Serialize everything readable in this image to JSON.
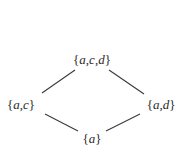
{
  "diagram": {
    "type": "hasse-diagram",
    "nodes": [
      {
        "id": "acd",
        "label": "{a,c,d}",
        "open": "{",
        "close": "}",
        "elements": [
          "a",
          "c",
          "d"
        ],
        "x": 92,
        "y": 59
      },
      {
        "id": "ac",
        "label": "{a,c}",
        "open": "{",
        "close": "}",
        "elements": [
          "a",
          "c"
        ],
        "x": 21,
        "y": 104
      },
      {
        "id": "ad",
        "label": "{a,d}",
        "open": "{",
        "close": "}",
        "elements": [
          "a",
          "d"
        ],
        "x": 161,
        "y": 104
      },
      {
        "id": "a",
        "label": "{a}",
        "open": "{",
        "close": "}",
        "elements": [
          "a"
        ],
        "x": 92,
        "y": 138
      }
    ],
    "edges": [
      {
        "from": "acd",
        "to": "ac",
        "x1": 75,
        "y1": 70,
        "x2": 42,
        "y2": 93
      },
      {
        "from": "acd",
        "to": "ad",
        "x1": 109,
        "y1": 70,
        "x2": 144,
        "y2": 94
      },
      {
        "from": "ac",
        "to": "a",
        "x1": 45,
        "y1": 114,
        "x2": 78,
        "y2": 131
      },
      {
        "from": "ad",
        "to": "a",
        "x1": 140,
        "y1": 114,
        "x2": 106,
        "y2": 131
      }
    ],
    "colors": {
      "line": "#3a3a3a",
      "text": "#2a2a2a",
      "background": "#ffffff"
    }
  }
}
